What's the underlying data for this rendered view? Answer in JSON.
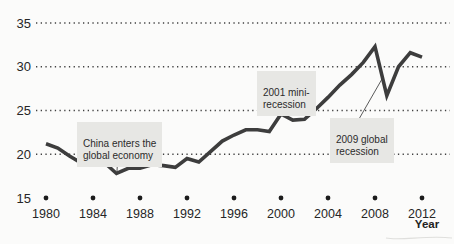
{
  "chart_data": {
    "type": "line",
    "title": "",
    "xlabel": "Year",
    "ylabel": "",
    "x": [
      1980,
      1981,
      1982,
      1983,
      1984,
      1985,
      1986,
      1987,
      1988,
      1989,
      1990,
      1991,
      1992,
      1993,
      1994,
      1995,
      1996,
      1997,
      1998,
      1999,
      2000,
      2001,
      2002,
      2003,
      2004,
      2005,
      2006,
      2007,
      2008,
      2009,
      2010,
      2011,
      2012
    ],
    "values": [
      21.2,
      20.7,
      19.8,
      19.0,
      19.3,
      19.0,
      17.8,
      18.4,
      18.4,
      18.8,
      18.7,
      18.5,
      19.5,
      19.1,
      20.3,
      21.5,
      22.2,
      22.8,
      22.8,
      22.6,
      24.6,
      23.9,
      24.0,
      25.2,
      26.5,
      27.9,
      29.1,
      30.5,
      32.3,
      26.7,
      30.0,
      31.6,
      31.1
    ],
    "x_ticks": [
      1980,
      1984,
      1988,
      1992,
      1996,
      2000,
      2004,
      2008,
      2012
    ],
    "y_ticks": [
      15,
      20,
      25,
      30,
      35
    ],
    "xlim": [
      1980,
      2012
    ],
    "ylim": [
      15,
      35
    ],
    "grid": "dotted horizontal lines at 20,25,30,35; round dot markers along the 15 baseline at each x tick",
    "legend": "none",
    "line_color": "#3d3d3d",
    "annotation_bg_color": "#e7e7e4",
    "annotations": [
      {
        "text": "China enters the\nglobal economy",
        "year": 1986,
        "value": 17.8
      },
      {
        "text": "2001 mini-\nrecession",
        "year": 2001,
        "value": 23.9
      },
      {
        "text": "2009 global\nrecession",
        "year": 2009,
        "value": 26.7
      }
    ]
  }
}
